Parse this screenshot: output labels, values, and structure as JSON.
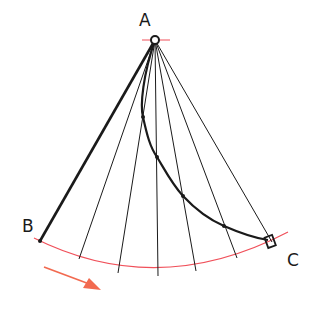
{
  "diagram": {
    "type": "pendulum-brachistochrone",
    "labels": {
      "pivot": "A",
      "left_end": "B",
      "right_end": "C"
    },
    "colors": {
      "ink": "#1a1a1a",
      "arc": "#f0505a",
      "arrow": "#f26a50"
    },
    "pivot": {
      "x": 155,
      "y": 40
    },
    "radial_line_endpoints": [
      {
        "x": 40,
        "y": 241
      },
      {
        "x": 79,
        "y": 259
      },
      {
        "x": 118,
        "y": 273
      },
      {
        "x": 158,
        "y": 276
      },
      {
        "x": 196,
        "y": 271
      },
      {
        "x": 237,
        "y": 258
      },
      {
        "x": 272,
        "y": 242
      }
    ],
    "curve_points": [
      {
        "x": 155,
        "y": 40
      },
      {
        "x": 143,
        "y": 117
      },
      {
        "x": 157,
        "y": 157
      },
      {
        "x": 183,
        "y": 196
      },
      {
        "x": 224,
        "y": 226
      },
      {
        "x": 268,
        "y": 240
      }
    ],
    "direction_arrow": "left-to-right along arc"
  }
}
